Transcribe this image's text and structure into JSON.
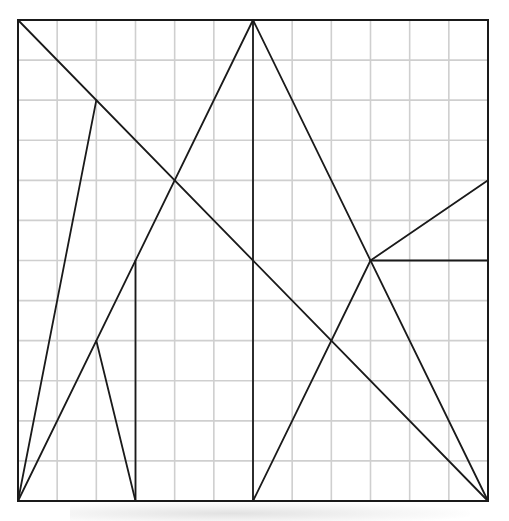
{
  "diagram": {
    "grid": {
      "cols": 12,
      "rows": 12,
      "origin_px": [
        18,
        20
      ],
      "size_px": [
        470,
        481
      ],
      "grid_line_color": "#cfcfcf",
      "stroke_color": "#1a1a1a"
    },
    "outline": {
      "points": [
        [
          0,
          0
        ],
        [
          12,
          0
        ],
        [
          12,
          12
        ],
        [
          0,
          12
        ]
      ]
    },
    "segments": [
      {
        "id": "main-diagonal",
        "from": [
          0,
          0
        ],
        "to": [
          12,
          12
        ]
      },
      {
        "id": "apex-left-leg",
        "from": [
          6,
          0
        ],
        "to": [
          0,
          12
        ]
      },
      {
        "id": "apex-right-leg",
        "from": [
          6,
          0
        ],
        "to": [
          12,
          12
        ]
      },
      {
        "id": "center-vertical",
        "from": [
          6,
          0
        ],
        "to": [
          6,
          12
        ]
      },
      {
        "id": "upper-left-spike",
        "from": [
          2,
          2
        ],
        "to": [
          0,
          12
        ]
      },
      {
        "id": "left-inner-vertical",
        "from": [
          3,
          6
        ],
        "to": [
          3,
          12
        ]
      },
      {
        "id": "lower-left-spike",
        "from": [
          2,
          8
        ],
        "to": [
          3,
          12
        ]
      },
      {
        "id": "right-node-to-edge-upper",
        "from": [
          9,
          6
        ],
        "to": [
          12,
          4
        ]
      },
      {
        "id": "right-node-horizontal",
        "from": [
          9,
          6
        ],
        "to": [
          12,
          6
        ]
      },
      {
        "id": "right-node-to-bottom",
        "from": [
          9,
          6
        ],
        "to": [
          6,
          12
        ]
      }
    ],
    "notable_points": [
      {
        "name": "top-left-corner",
        "at": [
          0,
          0
        ]
      },
      {
        "name": "top-apex",
        "at": [
          6,
          0
        ]
      },
      {
        "name": "upper-left-node",
        "at": [
          2,
          2
        ]
      },
      {
        "name": "diagonal-crossing",
        "at": [
          4,
          4
        ]
      },
      {
        "name": "center-crossing",
        "at": [
          6,
          6
        ]
      },
      {
        "name": "left-inner-node",
        "at": [
          3,
          6
        ]
      },
      {
        "name": "lower-left-node",
        "at": [
          2,
          8
        ]
      },
      {
        "name": "right-node",
        "at": [
          9,
          6
        ]
      },
      {
        "name": "lower-right-crossing",
        "at": [
          8,
          8
        ]
      },
      {
        "name": "right-edge-node",
        "at": [
          12,
          4
        ]
      },
      {
        "name": "bottom-right-corner",
        "at": [
          12,
          12
        ]
      }
    ]
  }
}
